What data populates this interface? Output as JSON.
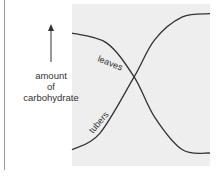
{
  "chart_data": {
    "type": "line",
    "title": "",
    "xlabel": "",
    "ylabel": "amount of carbohydrate",
    "ylabel_lines": [
      "amount",
      "of",
      "carbohydrate"
    ],
    "axis_arrow": "up",
    "grid": false,
    "series": [
      {
        "name": "leaves",
        "trend": "decreasing sigmoid",
        "x": [
          0,
          0.25,
          0.45,
          0.6,
          0.8,
          1.0
        ],
        "values": [
          0.82,
          0.76,
          0.55,
          0.3,
          0.1,
          0.08
        ]
      },
      {
        "name": "tubers",
        "trend": "increasing sigmoid",
        "x": [
          0,
          0.2,
          0.45,
          0.6,
          0.8,
          1.0
        ],
        "values": [
          0.1,
          0.2,
          0.55,
          0.78,
          0.92,
          0.94
        ]
      }
    ],
    "xlim": [
      0,
      1
    ],
    "ylim": [
      0,
      1
    ],
    "colors": {
      "line": "#333333",
      "plot_background": "#eeeeee"
    }
  }
}
